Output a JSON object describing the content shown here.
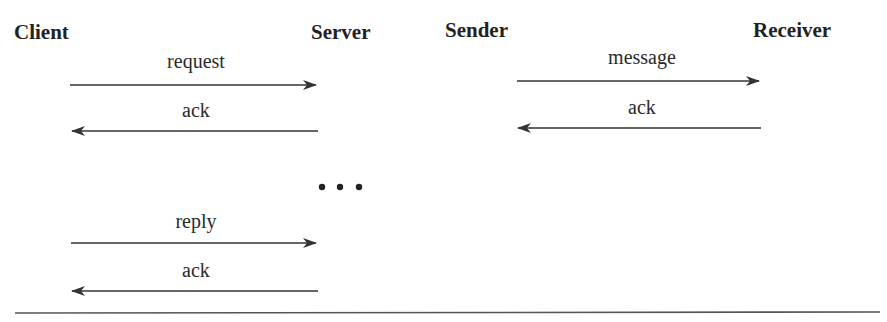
{
  "diagram": {
    "left": {
      "actors": {
        "from": "Client",
        "to": "Server"
      },
      "messages": [
        {
          "label": "request",
          "direction": "right"
        },
        {
          "label": "ack",
          "direction": "left"
        },
        {
          "label": "reply",
          "direction": "right"
        },
        {
          "label": "ack",
          "direction": "left"
        }
      ],
      "ellipsis": "• • •"
    },
    "right": {
      "actors": {
        "from": "Sender",
        "to": "Receiver"
      },
      "messages": [
        {
          "label": "message",
          "direction": "right"
        },
        {
          "label": "ack",
          "direction": "left"
        }
      ]
    },
    "colors": {
      "line": "#333333",
      "text": "#2a2a2a",
      "rule": "#555555"
    }
  }
}
